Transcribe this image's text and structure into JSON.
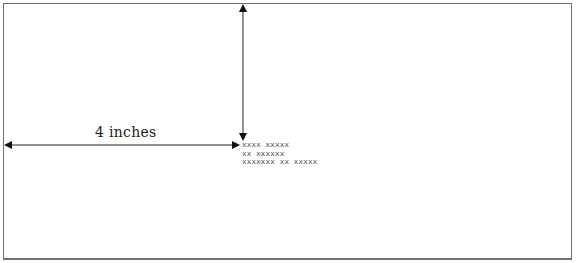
{
  "diagram": {
    "dimension_label": "4 inches",
    "address_lines": [
      "xxxx xxxxx",
      "xx xxxxxx",
      "xxxxxxx xx xxxxx"
    ]
  }
}
